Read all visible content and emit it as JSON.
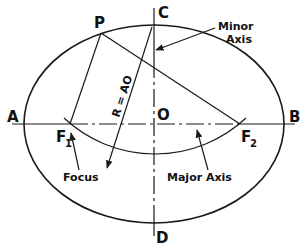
{
  "diagram": {
    "points": {
      "A": "A",
      "B": "B",
      "C": "C",
      "D": "D",
      "O": "O",
      "P": "P",
      "F1": {
        "letter": "F",
        "subscript": "1"
      },
      "F2": {
        "letter": "F",
        "subscript": "2"
      }
    },
    "labels": {
      "radius": "R = AO",
      "minor_axis_line1": "Minor",
      "minor_axis_line2": "Axis",
      "focus": "Focus",
      "major_axis": "Major Axis"
    },
    "colors": {
      "stroke": "#1a1a1a",
      "background": "#ffffff"
    }
  }
}
